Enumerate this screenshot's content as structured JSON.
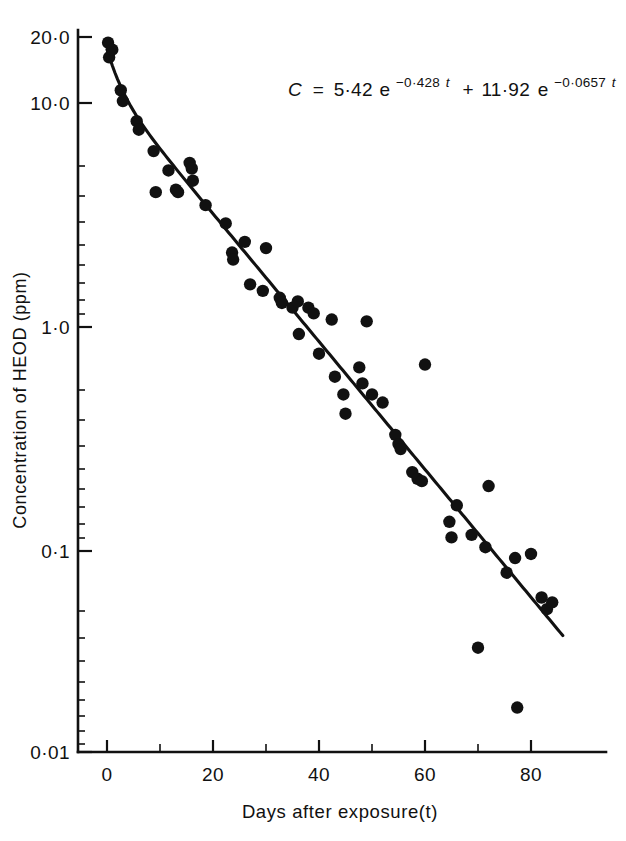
{
  "chart_data": {
    "type": "scatter",
    "title": "",
    "xlabel": "Days after exposure(t)",
    "ylabel": "Concentration of HEOD (ppm)",
    "yscale": "log",
    "xscale": "linear",
    "xlim": [
      -2,
      94
    ],
    "ylim": [
      0.01,
      24
    ],
    "xticks": [
      0,
      20,
      40,
      60,
      80
    ],
    "xtick_labels": [
      "0",
      "20",
      "40",
      "60",
      "80"
    ],
    "xminor_ticks": [
      10,
      30,
      50,
      70
    ],
    "yticks": [
      20.0,
      10.0,
      1.0,
      0.1,
      0.01
    ],
    "ytick_labels": [
      "20·0",
      "10·0",
      "1·0",
      "0·1",
      "0·01"
    ],
    "grid": false,
    "legend": "none",
    "annotation": {
      "equation_plain": "C = 5·42e^(-0·428t) + 11·92e^(-0·0657t)",
      "lhs": "C",
      "equals": "=",
      "amplitude_1": "5·42",
      "base_1": "e",
      "exponent_1": "−0·428",
      "exponent_1_var": "t",
      "plus": "+",
      "amplitude_2": "11·92",
      "base_2": "e",
      "exponent_2": "−0·0657",
      "exponent_2_var": "t"
    },
    "fit_model": {
      "description": "Sum of two exponentials",
      "a1": 5.42,
      "k1": 0.428,
      "a2": 11.92,
      "k2": 0.0657,
      "t_start": 0,
      "t_end": 86
    },
    "series": [
      {
        "name": "HEOD concentration observations",
        "marker": "filled-circle",
        "color": "#111111",
        "points": [
          {
            "x": 0.2,
            "y": 18.6
          },
          {
            "x": 0.4,
            "y": 16.0
          },
          {
            "x": 1.0,
            "y": 17.3
          },
          {
            "x": 2.6,
            "y": 11.4
          },
          {
            "x": 3.0,
            "y": 10.2
          },
          {
            "x": 5.6,
            "y": 8.3
          },
          {
            "x": 6.0,
            "y": 7.6
          },
          {
            "x": 8.8,
            "y": 6.1
          },
          {
            "x": 9.2,
            "y": 4.0
          },
          {
            "x": 11.6,
            "y": 5.0
          },
          {
            "x": 13.0,
            "y": 4.1
          },
          {
            "x": 13.4,
            "y": 4.0
          },
          {
            "x": 15.6,
            "y": 5.4
          },
          {
            "x": 16.0,
            "y": 5.1
          },
          {
            "x": 16.2,
            "y": 4.5
          },
          {
            "x": 18.6,
            "y": 3.5
          },
          {
            "x": 22.4,
            "y": 2.9
          },
          {
            "x": 23.6,
            "y": 2.15
          },
          {
            "x": 23.8,
            "y": 2.0
          },
          {
            "x": 26.0,
            "y": 2.4
          },
          {
            "x": 27.0,
            "y": 1.55
          },
          {
            "x": 29.4,
            "y": 1.45
          },
          {
            "x": 30.0,
            "y": 2.25
          },
          {
            "x": 32.6,
            "y": 1.35
          },
          {
            "x": 33.0,
            "y": 1.28
          },
          {
            "x": 35.0,
            "y": 1.22
          },
          {
            "x": 36.0,
            "y": 1.3
          },
          {
            "x": 36.2,
            "y": 0.93
          },
          {
            "x": 38.0,
            "y": 1.22
          },
          {
            "x": 39.0,
            "y": 1.15
          },
          {
            "x": 40.0,
            "y": 0.76
          },
          {
            "x": 42.4,
            "y": 1.08
          },
          {
            "x": 43.0,
            "y": 0.6
          },
          {
            "x": 44.6,
            "y": 0.5
          },
          {
            "x": 45.0,
            "y": 0.41
          },
          {
            "x": 47.6,
            "y": 0.66
          },
          {
            "x": 48.2,
            "y": 0.56
          },
          {
            "x": 49.0,
            "y": 1.06
          },
          {
            "x": 50.0,
            "y": 0.5
          },
          {
            "x": 52.0,
            "y": 0.46
          },
          {
            "x": 54.4,
            "y": 0.33
          },
          {
            "x": 55.0,
            "y": 0.3
          },
          {
            "x": 55.4,
            "y": 0.285
          },
          {
            "x": 57.6,
            "y": 0.225
          },
          {
            "x": 58.6,
            "y": 0.21
          },
          {
            "x": 59.4,
            "y": 0.205
          },
          {
            "x": 60.0,
            "y": 0.68
          },
          {
            "x": 64.6,
            "y": 0.135
          },
          {
            "x": 65.0,
            "y": 0.115
          },
          {
            "x": 66.0,
            "y": 0.16
          },
          {
            "x": 68.8,
            "y": 0.118
          },
          {
            "x": 70.0,
            "y": 0.037
          },
          {
            "x": 71.4,
            "y": 0.104
          },
          {
            "x": 72.0,
            "y": 0.195
          },
          {
            "x": 75.4,
            "y": 0.08
          },
          {
            "x": 77.0,
            "y": 0.093
          },
          {
            "x": 77.4,
            "y": 0.02
          },
          {
            "x": 80.0,
            "y": 0.097
          },
          {
            "x": 82.0,
            "y": 0.062
          },
          {
            "x": 83.0,
            "y": 0.055
          },
          {
            "x": 84.0,
            "y": 0.059
          }
        ]
      }
    ]
  }
}
